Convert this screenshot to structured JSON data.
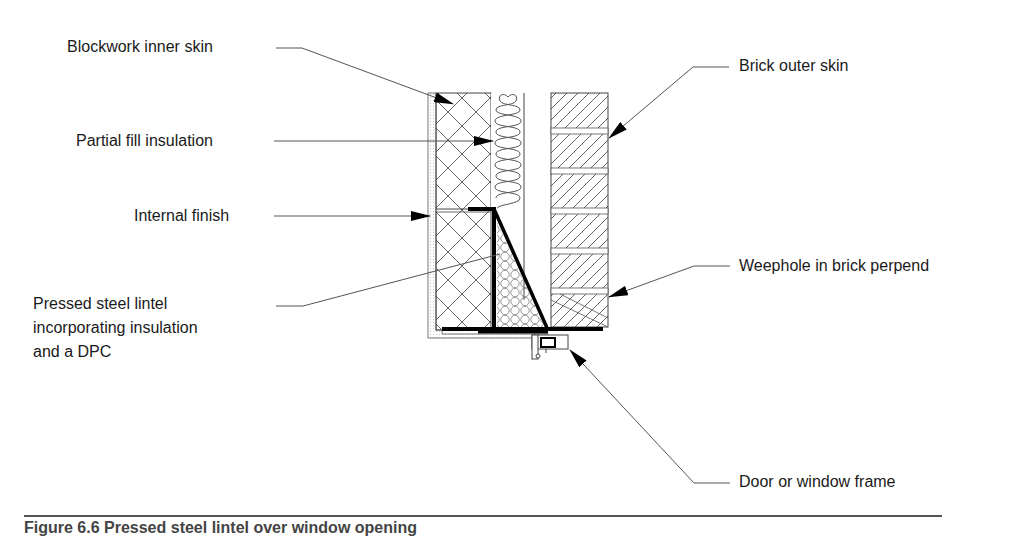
{
  "figure": {
    "type": "construction-detail-section"
  },
  "labels": {
    "blockwork_inner_skin": "Blockwork inner skin",
    "partial_fill_insulation": "Partial fill insulation",
    "internal_finish": "Internal finish",
    "pressed_steel_lintel": [
      "Pressed steel lintel",
      "incorporating insulation",
      "and a DPC"
    ],
    "brick_outer_skin": "Brick outer skin",
    "weephole": "Weephole in brick perpend",
    "door_window_frame": "Door or window frame"
  },
  "caption": {
    "text": "Figure 6.6  Pressed steel lintel over window opening"
  },
  "colors": {
    "line": "#333333",
    "heavy": "#000000",
    "text": "#1a1a1a",
    "background": "#ffffff"
  }
}
